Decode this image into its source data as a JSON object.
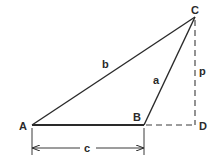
{
  "diagram": {
    "type": "triangle-with-altitude",
    "vertices": {
      "A": {
        "label": "A",
        "x": 32,
        "y": 125
      },
      "B": {
        "label": "B",
        "x": 144,
        "y": 125
      },
      "C": {
        "label": "C",
        "x": 195,
        "y": 17
      },
      "D": {
        "label": "D",
        "x": 195,
        "y": 125
      }
    },
    "sides": {
      "a": {
        "label": "a",
        "from": "B",
        "to": "C"
      },
      "b": {
        "label": "b",
        "from": "A",
        "to": "C"
      },
      "c": {
        "label": "c",
        "from": "A",
        "to": "B"
      },
      "p": {
        "label": "p",
        "from": "C",
        "to": "D",
        "style": "dashed"
      }
    },
    "extension": {
      "from": "B",
      "to": "D",
      "style": "dashed"
    },
    "dimension": {
      "label": "c",
      "from": "A",
      "to": "B",
      "y": 148
    }
  },
  "colors": {
    "stroke": "#2a2a2a",
    "background": "#ffffff"
  }
}
